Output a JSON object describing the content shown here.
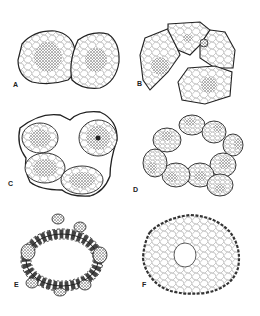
{
  "figure": {
    "panels": [
      {
        "label": "A",
        "description": "Two adjacent cells with stippled central nuclei"
      },
      {
        "label": "B",
        "description": "Four-cell cluster with stippled nuclei"
      },
      {
        "label": "C",
        "description": "Four-cell cluster enclosed in outer envelope"
      },
      {
        "label": "D",
        "description": "Ring of eight cells around central cavity"
      },
      {
        "label": "E",
        "description": "Ring of many small clustered cells around a cavity"
      },
      {
        "label": "F",
        "description": "Multicellular mass with reticulate cells around a central cavity"
      }
    ]
  }
}
